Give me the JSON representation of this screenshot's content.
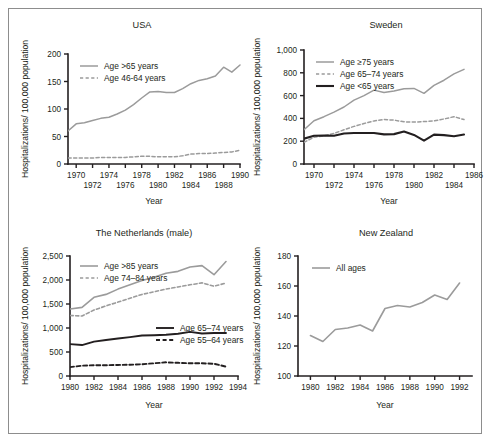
{
  "figure": {
    "background": "#ffffff",
    "border_color": "#8d8d8d",
    "colors": {
      "grey_line": "#9b9b9b",
      "black_line": "#231f20",
      "text": "#231f20"
    }
  },
  "chart_data": [
    {
      "id": "usa",
      "type": "line",
      "title": "USA",
      "xlabel": "Year",
      "ylabel": "Hospitalizations/ 100,000 population",
      "xlim": [
        1969,
        1990
      ],
      "ylim": [
        0,
        200
      ],
      "yticks": [
        0,
        50,
        100,
        150,
        200
      ],
      "yticklabels": [
        "0",
        "50",
        "100",
        "150",
        "200"
      ],
      "xticks": [
        1970,
        1972,
        1974,
        1976,
        1978,
        1980,
        1982,
        1984,
        1986,
        1988,
        1990
      ],
      "xticklabels": [
        "1970",
        "1972",
        "1974",
        "1976",
        "1978",
        "1980",
        "1982",
        "1984",
        "1986",
        "1988",
        "1990"
      ],
      "xtick_stagger": true,
      "grid": false,
      "legend_position": "top-left",
      "series": [
        {
          "name": "Age >65 years",
          "style": "solid",
          "color": "#9b9b9b",
          "width": 1.5,
          "x": [
            1969,
            1970,
            1971,
            1972,
            1973,
            1974,
            1975,
            1976,
            1977,
            1978,
            1979,
            1980,
            1981,
            1982,
            1983,
            1984,
            1985,
            1986,
            1987,
            1988,
            1989,
            1990
          ],
          "values": [
            60,
            73,
            75,
            79,
            83,
            85,
            91,
            98,
            108,
            120,
            131,
            132,
            130,
            130,
            137,
            146,
            152,
            155,
            160,
            176,
            167,
            180
          ]
        },
        {
          "name": "Age 46-64 years",
          "style": "dashed",
          "color": "#9b9b9b",
          "width": 1.5,
          "x": [
            1969,
            1970,
            1971,
            1972,
            1973,
            1974,
            1975,
            1976,
            1977,
            1978,
            1979,
            1980,
            1981,
            1982,
            1983,
            1984,
            1985,
            1986,
            1987,
            1988,
            1989,
            1990
          ],
          "values": [
            11,
            11,
            11,
            11,
            12,
            12,
            12,
            12,
            13,
            14,
            14,
            13,
            13,
            13,
            15,
            18,
            19,
            19,
            20,
            21,
            22,
            25
          ]
        }
      ]
    },
    {
      "id": "sweden",
      "type": "line",
      "title": "Sweden",
      "xlabel": "Year",
      "ylabel": "Hospitalizations/ 100,000 population",
      "xlim": [
        1969,
        1986
      ],
      "ylim": [
        0,
        1000
      ],
      "yticks": [
        0,
        200,
        400,
        600,
        800,
        1000
      ],
      "yticklabels": [
        "0",
        "200",
        "400",
        "600",
        "800",
        "1,000"
      ],
      "xticks": [
        1970,
        1972,
        1974,
        1976,
        1978,
        1980,
        1982,
        1984,
        1986
      ],
      "xticklabels": [
        "1970",
        "1972",
        "1974",
        "1976",
        "1978",
        "1980",
        "1982",
        "1984",
        "1986"
      ],
      "xtick_stagger": true,
      "grid": false,
      "legend_position": "top-left",
      "series": [
        {
          "name": "Age ≥75 years",
          "style": "solid",
          "color": "#9b9b9b",
          "width": 1.5,
          "x": [
            1969,
            1970,
            1971,
            1972,
            1973,
            1974,
            1975,
            1976,
            1977,
            1978,
            1979,
            1980,
            1981,
            1982,
            1983,
            1984,
            1985
          ],
          "values": [
            300,
            380,
            415,
            455,
            500,
            560,
            600,
            648,
            628,
            640,
            660,
            663,
            620,
            690,
            735,
            790,
            830,
            870
          ]
        },
        {
          "name": "Age 65–74 years",
          "style": "dashed",
          "color": "#9b9b9b",
          "width": 1.5,
          "x": [
            1969,
            1970,
            1971,
            1972,
            1973,
            1974,
            1975,
            1976,
            1977,
            1978,
            1979,
            1980,
            1981,
            1982,
            1983,
            1984,
            1985
          ],
          "values": [
            190,
            235,
            248,
            268,
            300,
            330,
            355,
            378,
            390,
            385,
            370,
            368,
            372,
            378,
            395,
            415,
            390,
            380
          ]
        },
        {
          "name": "Age <65 years",
          "style": "solid",
          "color": "#231f20",
          "width": 2.1,
          "x": [
            1969,
            1970,
            1971,
            1972,
            1973,
            1974,
            1975,
            1976,
            1977,
            1978,
            1979,
            1980,
            1981,
            1982,
            1983,
            1984,
            1985
          ],
          "values": [
            222,
            248,
            250,
            248,
            268,
            272,
            272,
            272,
            260,
            262,
            285,
            255,
            205,
            258,
            253,
            243,
            258,
            225
          ]
        }
      ]
    },
    {
      "id": "netherlands",
      "type": "line",
      "title": "The Netherlands (male)",
      "xlabel": "Year",
      "ylabel": "Hospitalizations/ 100,000 population",
      "xlim": [
        1980,
        1994
      ],
      "ylim": [
        0,
        2500
      ],
      "yticks": [
        0,
        500,
        1000,
        1500,
        2000,
        2500
      ],
      "yticklabels": [
        "0",
        "500",
        "1,000",
        "1,500",
        "2,000",
        "2,500"
      ],
      "xticks": [
        1980,
        1982,
        1984,
        1986,
        1988,
        1990,
        1992,
        1994
      ],
      "xticklabels": [
        "1980",
        "1982",
        "1984",
        "1986",
        "1988",
        "1990",
        "1992",
        "1994"
      ],
      "xtick_stagger": false,
      "grid": false,
      "legend_position": "split",
      "series": [
        {
          "name": "Age >85 years",
          "style": "solid",
          "color": "#9b9b9b",
          "width": 1.6,
          "x": [
            1980,
            1981,
            1982,
            1983,
            1984,
            1985,
            1986,
            1987,
            1988,
            1989,
            1990,
            1991,
            1992,
            1993
          ],
          "values": [
            1395,
            1430,
            1640,
            1700,
            1810,
            1900,
            1990,
            2055,
            2140,
            2180,
            2270,
            2300,
            2110,
            2385
          ]
        },
        {
          "name": "Age 74–84 years",
          "style": "dashed",
          "color": "#9b9b9b",
          "width": 1.6,
          "x": [
            1980,
            1981,
            1982,
            1983,
            1984,
            1985,
            1986,
            1987,
            1988,
            1989,
            1990,
            1991,
            1992,
            1993
          ],
          "values": [
            1260,
            1250,
            1375,
            1460,
            1540,
            1620,
            1700,
            1755,
            1810,
            1855,
            1900,
            1940,
            1870,
            1935
          ]
        },
        {
          "name": "Age 65–74 years",
          "style": "solid",
          "color": "#231f20",
          "width": 1.9,
          "x": [
            1980,
            1981,
            1982,
            1983,
            1984,
            1985,
            1986,
            1987,
            1988,
            1989,
            1990,
            1991,
            1992,
            1993
          ],
          "values": [
            665,
            645,
            715,
            750,
            780,
            810,
            845,
            850,
            860,
            880,
            920,
            885,
            895,
            895
          ]
        },
        {
          "name": "Age 55–64 years",
          "style": "dashed",
          "color": "#231f20",
          "width": 1.9,
          "x": [
            1980,
            1981,
            1982,
            1983,
            1984,
            1985,
            1986,
            1987,
            1988,
            1989,
            1990,
            1991,
            1992,
            1993
          ],
          "values": [
            185,
            215,
            225,
            225,
            230,
            235,
            245,
            265,
            285,
            275,
            265,
            265,
            255,
            195
          ]
        }
      ]
    },
    {
      "id": "newzealand",
      "type": "line",
      "title": "New Zealand",
      "xlabel": "Year",
      "ylabel": "Hospitalizations/ 100,000 population",
      "xlim": [
        1979,
        1993
      ],
      "ylim": [
        100,
        180
      ],
      "yticks": [
        100,
        120,
        140,
        160,
        180
      ],
      "yticklabels": [
        "100",
        "120",
        "140",
        "160",
        "180"
      ],
      "xticks": [
        1980,
        1982,
        1984,
        1986,
        1988,
        1990,
        1992
      ],
      "xticklabels": [
        "1980",
        "1982",
        "1984",
        "1986",
        "1988",
        "1990",
        "1992"
      ],
      "xtick_stagger": false,
      "grid": false,
      "legend_position": "top-left",
      "series": [
        {
          "name": "All ages",
          "style": "solid",
          "color": "#9b9b9b",
          "width": 1.6,
          "x": [
            1980,
            1981,
            1982,
            1983,
            1984,
            1985,
            1986,
            1987,
            1988,
            1989,
            1990,
            1991,
            1992
          ],
          "values": [
            127,
            123,
            131,
            132,
            134,
            130,
            145,
            147,
            146,
            149,
            154,
            151,
            162
          ]
        }
      ]
    }
  ]
}
